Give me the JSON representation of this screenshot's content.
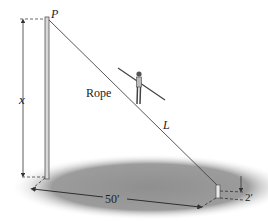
{
  "figure": {
    "labels": {
      "top_point": "P",
      "height_var": "x",
      "rope": "Rope",
      "rope_length": "L",
      "ground_distance": "50′",
      "post_height": "2′"
    },
    "colors": {
      "line": "#333333",
      "ground_shadow": "#9a9a9a",
      "pole_fill": "#d8d8d8",
      "background": "#ffffff"
    }
  }
}
